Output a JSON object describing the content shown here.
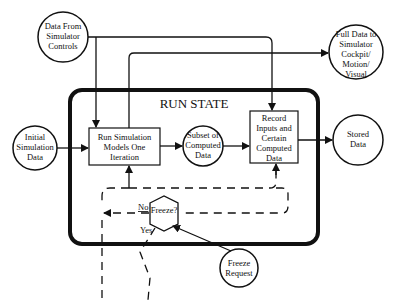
{
  "diagram": {
    "title": "RUN STATE",
    "nodes": {
      "data_from_controls": [
        "Data From",
        "Simulator",
        "Controls"
      ],
      "full_data": [
        "Full Data to",
        "Simulator",
        "Cockpit/",
        "Motion/",
        "Visual"
      ],
      "initial_data": [
        "Initial",
        "Simulation",
        "Data"
      ],
      "run_models": [
        "Run Simulation",
        "Models One",
        "Iteration"
      ],
      "subset_data": [
        "Subset of",
        "Computed",
        "Data"
      ],
      "record_inputs": [
        "Record",
        "Inputs and",
        "Certain",
        "Computed",
        "Data"
      ],
      "stored_data": [
        "Stored",
        "Data"
      ],
      "freeze_decision": "Freeze?",
      "freeze_request": [
        "Freeze",
        "Request"
      ]
    },
    "edge_labels": {
      "no": "No",
      "yes": "Yes"
    }
  }
}
